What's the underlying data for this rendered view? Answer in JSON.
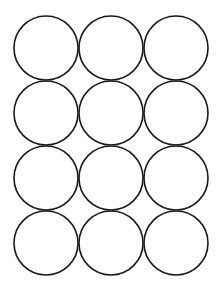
{
  "figure": {
    "rows": 4,
    "cols": 3,
    "stroke_color": "#1a1a1a",
    "fill_color": "#ffffff",
    "background": "#ffffff",
    "radius": 32,
    "stroke_width": 1.6,
    "col_centers": [
      46,
      111,
      176
    ],
    "row_centers": [
      48,
      113,
      178,
      243
    ]
  }
}
